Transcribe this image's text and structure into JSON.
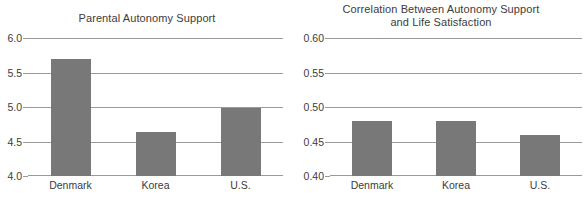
{
  "figure": {
    "width": 588,
    "height": 198,
    "background_color": "#ffffff",
    "bar_color": "#787878",
    "gridline_color": "#9a9a9a",
    "text_color": "#3c3c3c"
  },
  "chart_data": [
    {
      "type": "bar",
      "title": "Parental Autonomy Support",
      "xlabel": "",
      "ylabel": "",
      "categories": [
        "Denmark",
        "Korea",
        "U.S."
      ],
      "values": [
        5.7,
        4.64,
        4.99
      ],
      "ylim": [
        4.0,
        6.0
      ],
      "yticks": [
        4.0,
        4.5,
        5.0,
        5.5,
        6.0
      ],
      "ytick_labels": [
        "4.0",
        "4.5",
        "5.0",
        "5.5",
        "6.0"
      ],
      "grid": true,
      "legend": false
    },
    {
      "type": "bar",
      "title": "Correlation Between Autonomy Support\nand Life Satisfaction",
      "xlabel": "",
      "ylabel": "",
      "categories": [
        "Denmark",
        "Korea",
        "U.S."
      ],
      "values": [
        0.48,
        0.48,
        0.46
      ],
      "ylim": [
        0.4,
        0.6
      ],
      "yticks": [
        0.4,
        0.45,
        0.5,
        0.55,
        0.6
      ],
      "ytick_labels": [
        "0.40",
        "0.45",
        "0.50",
        "0.55",
        "0.60"
      ],
      "grid": true,
      "legend": false
    }
  ]
}
